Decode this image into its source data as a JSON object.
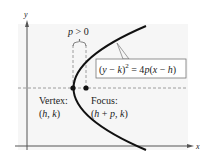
{
  "diagram": {
    "axes": {
      "x_label": "x",
      "y_label": "y"
    },
    "distance_label": {
      "var": "p",
      "rest": " > 0"
    },
    "equation": {
      "lhs_open": "(",
      "y": "y",
      "minus1": " − ",
      "k": "k",
      "lhs_close": ")",
      "exponent": "2",
      "eq": " = 4",
      "p": "p",
      "rhs_open": "(",
      "x": "x",
      "minus2": " − ",
      "h": "h",
      "rhs_close": ")"
    },
    "vertex": {
      "title": "Vertex:",
      "coord_open": "(",
      "h": "h",
      "comma": ", ",
      "k": "k",
      "coord_close": ")"
    },
    "focus": {
      "title": "Focus:",
      "coord_open": "(",
      "h": "h",
      "plus": " + ",
      "p": "p",
      "comma": ", ",
      "k": "k",
      "coord_close": ")"
    },
    "colors": {
      "curve": "#111111",
      "axis": "#555555",
      "dashed": "#888888",
      "plot_bg": "#f6f6f6",
      "text": "#222222"
    }
  }
}
